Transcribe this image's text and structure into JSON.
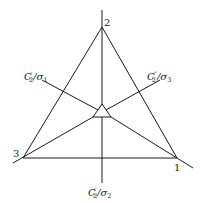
{
  "diagram": {
    "vertices": [
      {
        "id": "1",
        "label": "1"
      },
      {
        "id": "2",
        "label": "2"
      },
      {
        "id": "3",
        "label": "3"
      }
    ],
    "axes": [
      {
        "id": "c2-prime",
        "base": "C",
        "sub": "2",
        "prime": "′",
        "sep": "/",
        "sigma": "σ",
        "sigma_sub": "1"
      },
      {
        "id": "c2-triple-prime",
        "base": "C",
        "sub": "2",
        "prime": "‴",
        "sep": "/",
        "sigma": "σ",
        "sigma_sub": "3"
      },
      {
        "id": "c2-double-prime",
        "base": "C",
        "sub": "2",
        "prime": "″",
        "sep": "/",
        "sigma": "σ",
        "sigma_sub": "2"
      }
    ]
  }
}
